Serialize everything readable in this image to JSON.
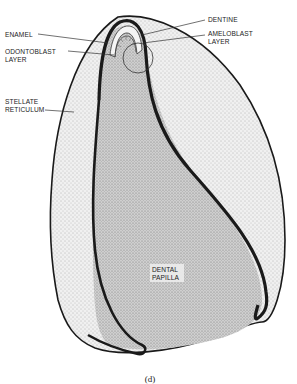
{
  "figure": {
    "caption": "(d)",
    "colors": {
      "background": "#ffffff",
      "outline": "#1a1a1a",
      "stellate_reticulum_fill": "#e4e4e4",
      "dental_papilla_fill": "#c8c8c8",
      "enamel_fill": "#f2f2f2"
    }
  },
  "labels": {
    "dentine": "DENTINE",
    "ameloblast_line1": "AMELOBLAST",
    "ameloblast_line2": "LAYER",
    "enamel": "ENAMEL",
    "odontoblast_line1": "ODONTOBLAST",
    "odontoblast_line2": "LAYER",
    "stellate_line1": "STELLATE",
    "stellate_line2": "RETICULUM",
    "papilla_line1": "DENTAL",
    "papilla_line2": "PAPILLA"
  }
}
